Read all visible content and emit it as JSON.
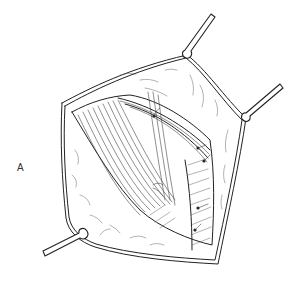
{
  "figure": {
    "panel_label": "A",
    "colors": {
      "ink": "#222222",
      "background": "#ffffff"
    },
    "retractors": [
      {
        "name": "top-retractor"
      },
      {
        "name": "right-retractor"
      },
      {
        "name": "lower-left-retractor"
      }
    ]
  }
}
